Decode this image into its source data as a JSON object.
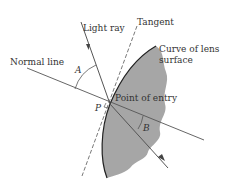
{
  "diagram": {
    "labels": {
      "light_ray": "Light ray",
      "tangent": "Tangent",
      "curve_line1": "Curve of lens",
      "curve_line2": "surface",
      "normal_line": "Normal line",
      "angle_a": "A",
      "angle_b": "B",
      "point_p": "P",
      "point_of_entry": "Point of entry"
    },
    "colors": {
      "lens_fill": "#a6a6a6",
      "line": "#555555",
      "curve": "#222222",
      "background": "#ffffff"
    }
  }
}
